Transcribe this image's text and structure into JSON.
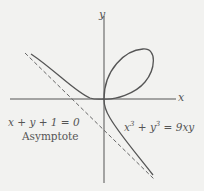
{
  "diagram": {
    "axes": {
      "x_label": "x",
      "y_label": "y"
    },
    "curve": {
      "equation_parts": {
        "x": "x",
        "exp1": "3",
        "plus": " + ",
        "y": "y",
        "exp2": "3",
        "rhs": " = 9xy"
      },
      "equation": "x^3 + y^3 = 9xy",
      "color": "#555555"
    },
    "asymptote": {
      "equation": "x + y  + 1 = 0",
      "label": "Asymptote",
      "style": "dashed",
      "color": "#666666"
    },
    "colors": {
      "background": "#f2f2f0",
      "axes": "#555555",
      "curve": "#555555"
    }
  }
}
